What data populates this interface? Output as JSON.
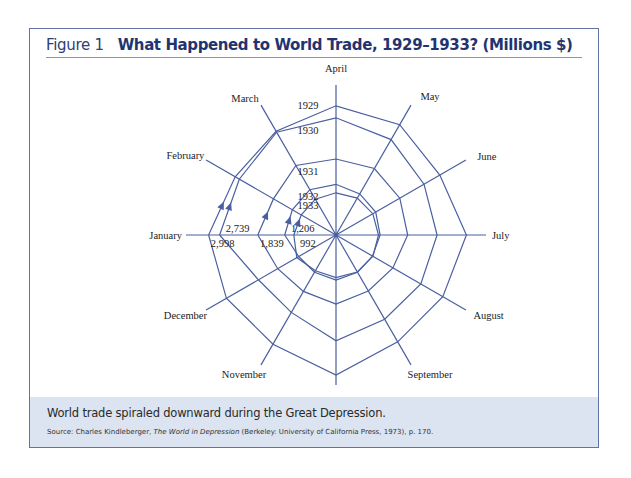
{
  "figure": {
    "label": "Figure 1",
    "title": "What Happened to World Trade, 1929–1933? (Millions $)",
    "caption": "World trade spiraled downward during the Great Depression.",
    "source_prefix": "Source: Charles Kindleberger, ",
    "source_title": "The World in Depression",
    "source_suffix": " (Berkeley: University of California Press, 1973), p. 170."
  },
  "colors": {
    "line": "#4a5fa0",
    "border": "#6173a6",
    "title": "#1f3470",
    "caption_bg": "#dbe4f0"
  },
  "chart_data": {
    "type": "radar",
    "title": "What Happened to World Trade, 1929–1933? (Millions $)",
    "categories": [
      "January",
      "February",
      "March",
      "April",
      "May",
      "June",
      "July",
      "August",
      "September",
      "October",
      "November",
      "December"
    ],
    "series": [
      {
        "name": "1929",
        "values": [
          2998,
          2739,
          2818,
          3039,
          2998,
          2820,
          3069,
          2902,
          2903,
          3296,
          2967,
          2978
        ]
      },
      {
        "name": "1930",
        "values": [
          2739,
          2627,
          2793,
          2757,
          2592,
          2392,
          2380,
          2303,
          2291,
          2486,
          2102,
          2107
        ]
      },
      {
        "name": "1931",
        "values": [
          1839,
          1700,
          1889,
          1788,
          1807,
          1734,
          1686,
          1547,
          1521,
          1624,
          1533,
          1585
        ]
      },
      {
        "name": "1932",
        "values": [
          1206,
          1186,
          1231,
          1193,
          1118,
          1078,
          1038,
          993,
          1012,
          1060,
          1010,
          1014
        ]
      },
      {
        "name": "1933",
        "values": [
          992,
          944,
          973,
          992,
          1002,
          1000,
          1001,
          1002,
          1004,
          1003,
          971,
          1065
        ]
      }
    ],
    "annotations": {
      "january_labels": [
        "2,998",
        "2,739",
        "1,839",
        "1,206",
        "992"
      ],
      "year_labels": [
        "1929",
        "1930",
        "1931",
        "1932",
        "1933"
      ]
    },
    "note": "Monthly values other than January are approximated from the drawn spiral.",
    "grid": false,
    "legend": "none"
  }
}
